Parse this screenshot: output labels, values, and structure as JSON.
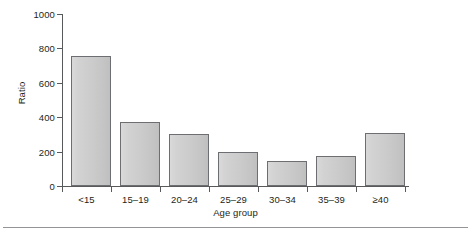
{
  "chart_data": {
    "type": "bar",
    "title": "",
    "subtitle": "",
    "xlabel": "Age group",
    "ylabel": "Ratio",
    "categories": [
      "<15",
      "15–19",
      "20–24",
      "25–29",
      "30–34",
      "35–39",
      "≥40"
    ],
    "values": [
      755,
      370,
      300,
      198,
      147,
      176,
      308
    ],
    "ylim": [
      0,
      1000
    ],
    "ytick_labels": [
      "0",
      "200",
      "400",
      "600",
      "800",
      "1000"
    ],
    "ytick_values": [
      0,
      200,
      400,
      600,
      800,
      1000
    ],
    "grid": false,
    "legend": null,
    "legend_position": "none",
    "annotations": [],
    "bar_fill_color": "#cfcfcf",
    "bar_edge_color": "#6d6e71",
    "axis_color": "#58595b",
    "text_color": "#231f20",
    "background_color": "#ffffff"
  }
}
